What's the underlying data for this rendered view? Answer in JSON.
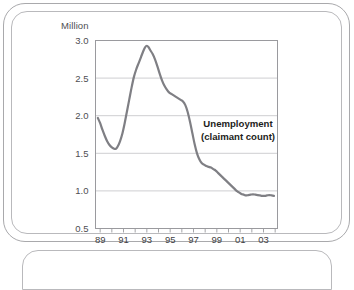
{
  "frame": {
    "border_color": "#a9a9ac",
    "inner_border_color": "#b9b9bc",
    "background": "#ffffff"
  },
  "chart_data": {
    "type": "line",
    "title": "",
    "subtitle": "",
    "xlabel": "",
    "ylabel": "Million",
    "unit_label": "Million",
    "annotations": [
      {
        "text_line1": "Unemployment",
        "text_line2": "(claimant count)",
        "x": 1997.9,
        "y": 1.78
      }
    ],
    "legend": {
      "entries": [
        "Unemployment (claimant count)"
      ],
      "position": "inside-right"
    },
    "grid": {
      "horizontal": true,
      "vertical": false,
      "color": "#c8c8cc"
    },
    "axis": {
      "line_color": "#9a9a9e",
      "xlim": [
        1988.6,
        2004.2
      ],
      "ylim": [
        0.5,
        3.0
      ],
      "ytick_labels": [
        "3.0",
        "2.5",
        "2.0",
        "1.5",
        "1.0",
        "0.5"
      ],
      "ytick_values": [
        3.0,
        2.5,
        2.0,
        1.5,
        1.0,
        0.5
      ],
      "xtick_labels": [
        "89",
        "91",
        "93",
        "95",
        "97",
        "99",
        "01",
        "03"
      ],
      "xtick_values": [
        1989,
        1991,
        1993,
        1995,
        1997,
        1999,
        2001,
        2003
      ],
      "xminor_tick_values": [
        1989,
        1990,
        1991,
        1992,
        1993,
        1994,
        1995,
        1996,
        1997,
        1998,
        1999,
        2000,
        2001,
        2002,
        2003,
        2004
      ]
    },
    "series": [
      {
        "name": "Unemployment (claimant count)",
        "color": "#7f7f84",
        "line_width": 2.2,
        "x": [
          1988.8,
          1989.0,
          1989.2,
          1989.4,
          1989.6,
          1989.8,
          1990.0,
          1990.2,
          1990.35,
          1990.5,
          1990.7,
          1990.9,
          1991.1,
          1991.3,
          1991.5,
          1991.7,
          1991.9,
          1992.1,
          1992.3,
          1992.5,
          1992.7,
          1992.85,
          1993.0,
          1993.15,
          1993.3,
          1993.5,
          1993.7,
          1993.9,
          1994.1,
          1994.3,
          1994.5,
          1994.7,
          1994.9,
          1995.1,
          1995.3,
          1995.5,
          1995.7,
          1995.9,
          1996.1,
          1996.3,
          1996.5,
          1996.7,
          1996.9,
          1997.1,
          1997.3,
          1997.5,
          1997.7,
          1997.9,
          1998.1,
          1998.3,
          1998.5,
          1998.7,
          1998.9,
          1999.1,
          1999.3,
          1999.5,
          1999.7,
          1999.9,
          2000.1,
          2000.3,
          2000.5,
          2000.7,
          2000.9,
          2001.1,
          2001.3,
          2001.5,
          2001.7,
          2001.9,
          2002.1,
          2002.3,
          2002.5,
          2002.7,
          2002.9,
          2003.1,
          2003.3,
          2003.5,
          2003.7,
          2003.9
        ],
        "y": [
          1.97,
          1.9,
          1.81,
          1.73,
          1.66,
          1.61,
          1.58,
          1.56,
          1.56,
          1.59,
          1.66,
          1.76,
          1.9,
          2.06,
          2.22,
          2.38,
          2.52,
          2.62,
          2.7,
          2.78,
          2.86,
          2.91,
          2.93,
          2.91,
          2.87,
          2.82,
          2.75,
          2.66,
          2.56,
          2.47,
          2.4,
          2.35,
          2.31,
          2.29,
          2.27,
          2.25,
          2.23,
          2.21,
          2.19,
          2.14,
          2.05,
          1.92,
          1.77,
          1.62,
          1.5,
          1.42,
          1.37,
          1.35,
          1.33,
          1.32,
          1.31,
          1.29,
          1.27,
          1.24,
          1.21,
          1.18,
          1.15,
          1.12,
          1.09,
          1.06,
          1.03,
          1.0,
          0.98,
          0.96,
          0.95,
          0.94,
          0.945,
          0.95,
          0.955,
          0.95,
          0.945,
          0.94,
          0.935,
          0.935,
          0.94,
          0.945,
          0.94,
          0.935
        ]
      }
    ]
  }
}
